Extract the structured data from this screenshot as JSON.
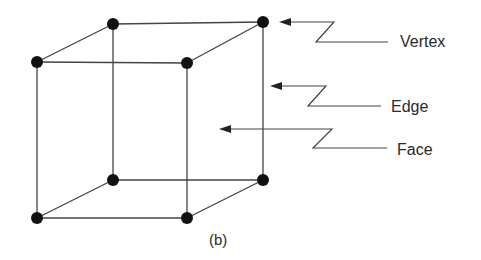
{
  "figure": {
    "caption": "(b)",
    "labels": {
      "vertex": "Vertex",
      "edge": "Edge",
      "face": "Face"
    },
    "colors": {
      "stroke": "#444444",
      "vertex": "#111111",
      "text": "#2a2a2a"
    },
    "vertices": [
      {
        "x": 113,
        "y": 24
      },
      {
        "x": 263,
        "y": 22
      },
      {
        "x": 37,
        "y": 62
      },
      {
        "x": 187,
        "y": 63
      },
      {
        "x": 113,
        "y": 180
      },
      {
        "x": 263,
        "y": 180
      },
      {
        "x": 37,
        "y": 218
      },
      {
        "x": 187,
        "y": 218
      }
    ]
  }
}
